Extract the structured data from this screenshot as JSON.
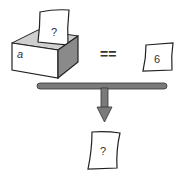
{
  "diagram": {
    "box": {
      "variable_label": "a",
      "content_label": "?"
    },
    "operator": "==",
    "compare_card": {
      "label": "6"
    },
    "result_card": {
      "label": "?"
    },
    "colors": {
      "stroke": "#222222",
      "box_side": "#8a8a8a",
      "box_inner": "#cfcfcf",
      "bar_fill": "#7a7a7a",
      "paper": "#ffffff"
    }
  }
}
